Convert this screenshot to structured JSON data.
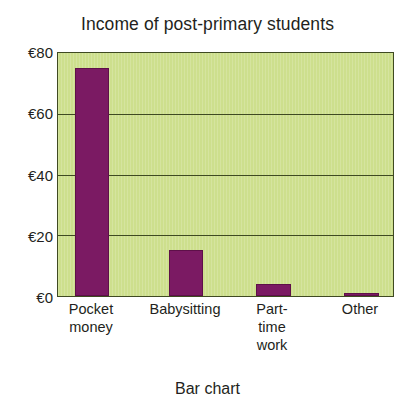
{
  "chart_data": {
    "type": "bar",
    "title": "Income of post-primary students",
    "caption": "Bar chart",
    "xlabel": "",
    "ylabel": "",
    "categories": [
      "Pocket money",
      "Babysitting",
      "Part-time work",
      "Other"
    ],
    "values": [
      75,
      15,
      4,
      1
    ],
    "ylim": [
      0,
      80
    ],
    "yticks": [
      0,
      20,
      40,
      60,
      80
    ],
    "ytick_labels": [
      "€0",
      "€20",
      "€40",
      "€60",
      "€80"
    ],
    "currency_symbol": "€",
    "grid": true,
    "legend": "none",
    "series": [
      {
        "name": "Income",
        "values": [
          75,
          15,
          4,
          1
        ]
      }
    ],
    "bar_color": "#7b1a63",
    "plot_background_color": "#cddf8d",
    "axis_color": "#3f4a22",
    "text_color": "#231f20",
    "page_background_color": "#ffffff"
  }
}
